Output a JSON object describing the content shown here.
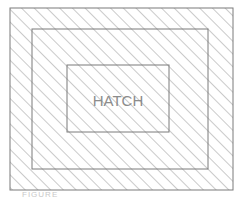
{
  "diagram": {
    "label": "HATCH",
    "caption": "FIGURE",
    "colors": {
      "line": "#7a7a7a",
      "hatch": "#8a8a8a",
      "text": "#8c8c8c",
      "background": "#ffffff"
    },
    "rects": {
      "outer": {
        "x": 10,
        "y": 8,
        "w": 223,
        "h": 182
      },
      "middle": {
        "x": 32,
        "y": 29,
        "w": 176,
        "h": 140
      },
      "inner": {
        "x": 67,
        "y": 65,
        "w": 102,
        "h": 67
      }
    },
    "hatch": {
      "angle_deg": 45,
      "spacing_px": 9
    }
  }
}
